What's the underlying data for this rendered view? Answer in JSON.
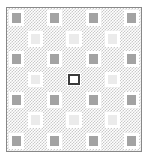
{
  "board": {
    "title": "Checkerboard Grid",
    "rows": 7,
    "columns": 7,
    "background_pattern": "fine-checker-hatch",
    "frame_color": "#888888",
    "page_background": "#ffffff",
    "pattern_color": "#c9c9c9",
    "colors": {
      "dark_tile": "#a3a3a3",
      "light_tile": "#ebebeb",
      "selected_fill": "#ffffff",
      "selected_border": "#3a3a3a",
      "tile_gap": "#ffffff"
    },
    "selected_cell": {
      "row": 4,
      "column": 4,
      "label": "selected-cell"
    },
    "cells": [
      [
        {
          "kind": "dark",
          "label": "tile-r1c1"
        },
        {
          "kind": "empty",
          "label": "tile-r1c2"
        },
        {
          "kind": "dark",
          "label": "tile-r1c3"
        },
        {
          "kind": "empty",
          "label": "tile-r1c4"
        },
        {
          "kind": "dark",
          "label": "tile-r1c5"
        },
        {
          "kind": "empty",
          "label": "tile-r1c6"
        },
        {
          "kind": "dark",
          "label": "tile-r1c7"
        }
      ],
      [
        {
          "kind": "empty",
          "label": "tile-r2c1"
        },
        {
          "kind": "light",
          "label": "tile-r2c2"
        },
        {
          "kind": "empty",
          "label": "tile-r2c3"
        },
        {
          "kind": "light",
          "label": "tile-r2c4"
        },
        {
          "kind": "empty",
          "label": "tile-r2c5"
        },
        {
          "kind": "light",
          "label": "tile-r2c6"
        },
        {
          "kind": "empty",
          "label": "tile-r2c7"
        }
      ],
      [
        {
          "kind": "dark",
          "label": "tile-r3c1"
        },
        {
          "kind": "empty",
          "label": "tile-r3c2"
        },
        {
          "kind": "dark",
          "label": "tile-r3c3"
        },
        {
          "kind": "empty",
          "label": "tile-r3c4"
        },
        {
          "kind": "dark",
          "label": "tile-r3c5"
        },
        {
          "kind": "empty",
          "label": "tile-r3c6"
        },
        {
          "kind": "dark",
          "label": "tile-r3c7"
        }
      ],
      [
        {
          "kind": "empty",
          "label": "tile-r4c1"
        },
        {
          "kind": "light",
          "label": "tile-r4c2"
        },
        {
          "kind": "empty",
          "label": "tile-r4c3"
        },
        {
          "kind": "selected",
          "label": "tile-r4c4"
        },
        {
          "kind": "empty",
          "label": "tile-r4c5"
        },
        {
          "kind": "light",
          "label": "tile-r4c6"
        },
        {
          "kind": "empty",
          "label": "tile-r4c7"
        }
      ],
      [
        {
          "kind": "dark",
          "label": "tile-r5c1"
        },
        {
          "kind": "empty",
          "label": "tile-r5c2"
        },
        {
          "kind": "dark",
          "label": "tile-r5c3"
        },
        {
          "kind": "empty",
          "label": "tile-r5c4"
        },
        {
          "kind": "dark",
          "label": "tile-r5c5"
        },
        {
          "kind": "empty",
          "label": "tile-r5c6"
        },
        {
          "kind": "dark",
          "label": "tile-r5c7"
        }
      ],
      [
        {
          "kind": "empty",
          "label": "tile-r6c1"
        },
        {
          "kind": "light",
          "label": "tile-r6c2"
        },
        {
          "kind": "empty",
          "label": "tile-r6c3"
        },
        {
          "kind": "light",
          "label": "tile-r6c4"
        },
        {
          "kind": "empty",
          "label": "tile-r6c5"
        },
        {
          "kind": "light",
          "label": "tile-r6c6"
        },
        {
          "kind": "empty",
          "label": "tile-r6c7"
        }
      ],
      [
        {
          "kind": "dark",
          "label": "tile-r7c1"
        },
        {
          "kind": "empty",
          "label": "tile-r7c2"
        },
        {
          "kind": "dark",
          "label": "tile-r7c3"
        },
        {
          "kind": "empty",
          "label": "tile-r7c4"
        },
        {
          "kind": "dark",
          "label": "tile-r7c5"
        },
        {
          "kind": "empty",
          "label": "tile-r7c6"
        },
        {
          "kind": "dark",
          "label": "tile-r7c7"
        }
      ]
    ]
  }
}
